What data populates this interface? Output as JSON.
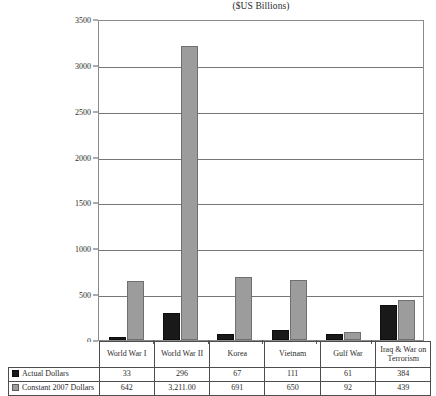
{
  "chart_data": {
    "type": "bar",
    "title": "($US Billions)",
    "xlabel": "",
    "ylabel": "",
    "ylim": [
      0,
      3500
    ],
    "yticks": [
      0,
      500,
      1000,
      1500,
      2000,
      2500,
      3000,
      3500
    ],
    "grid": true,
    "legend_position": "table-left",
    "categories": [
      "World  War I",
      "World War II",
      "Korea",
      "Vietnam",
      "Gulf  War",
      "Iraq & War on Terrorism"
    ],
    "series": [
      {
        "name": "Actual Dollars",
        "color": "#191919",
        "values": [
          33,
          296,
          67,
          111,
          61,
          384
        ],
        "labels": [
          "33",
          "296",
          "67",
          "111",
          "61",
          "384"
        ]
      },
      {
        "name": "Constant 2007 Dollars",
        "color": "#9c9c9c",
        "values": [
          642,
          3211,
          691,
          650,
          92,
          439
        ],
        "labels": [
          "642",
          "3,211.00",
          "691",
          "650",
          "92",
          "439"
        ]
      }
    ]
  },
  "yticks": {
    "t0": "0",
    "t1": "500",
    "t2": "1000",
    "t3": "1500",
    "t4": "2000",
    "t5": "2500",
    "t6": "3000",
    "t7": "3500"
  },
  "table": {
    "categories": [
      "World  War I",
      "World War II",
      "Korea",
      "Vietnam",
      "Gulf  War",
      "Iraq & War on Terrorism"
    ],
    "rows": [
      {
        "label": "Actual Dollars",
        "swatch": "black-square-icon",
        "cells": [
          "33",
          "296",
          "67",
          "111",
          "61",
          "384"
        ]
      },
      {
        "label": "Constant 2007 Dollars",
        "swatch": "gray-square-icon",
        "cells": [
          "642",
          "3,211.00",
          "691",
          "650",
          "92",
          "439"
        ]
      }
    ]
  }
}
